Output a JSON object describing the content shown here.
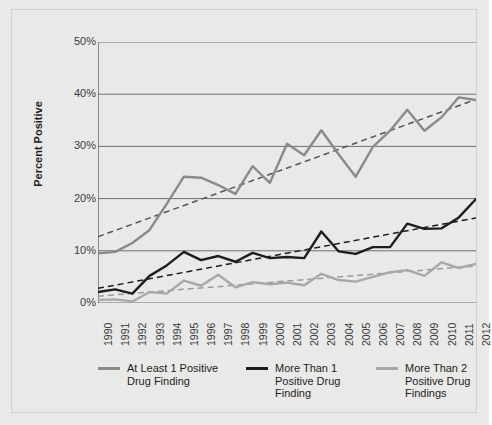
{
  "chart_data": {
    "type": "line",
    "title": "",
    "xlabel": "",
    "ylabel": "Percent Positive",
    "ylim": [
      0,
      50
    ],
    "ytick_labels": [
      "0%",
      "10%",
      "20%",
      "30%",
      "40%",
      "50%"
    ],
    "ytick_values": [
      0,
      10,
      20,
      30,
      40,
      50
    ],
    "grid": true,
    "legend_position": "bottom",
    "categories": [
      1990,
      1991,
      1992,
      1993,
      1994,
      1995,
      1996,
      1997,
      1998,
      1999,
      2000,
      2001,
      2002,
      2003,
      2004,
      2005,
      2006,
      2007,
      2008,
      2009,
      2010,
      2011,
      2012
    ],
    "xtick_labels": [
      "1990",
      "1991",
      "1992",
      "1993",
      "1994",
      "1995",
      "1996",
      "1997",
      "1998",
      "1999",
      "2000",
      "2001",
      "2002",
      "2003",
      "2004",
      "2005",
      "2006",
      "2007",
      "2008",
      "2009",
      "2010",
      "2011",
      "2012"
    ],
    "series": [
      {
        "name": "At Least 1 Positive Drug Finding",
        "color": "#8a8a88",
        "width": 2.4,
        "values": [
          9.5,
          9.8,
          11.5,
          14.0,
          19.0,
          24.2,
          24.0,
          22.6,
          20.9,
          26.2,
          23.0,
          30.5,
          28.3,
          33.1,
          28.5,
          24.2,
          29.9,
          33.0,
          37.0,
          33.0,
          35.6,
          39.4,
          38.9
        ],
        "trend": {
          "style": "dashed",
          "color": "#555553",
          "start": 12.7,
          "end": 39.0
        }
      },
      {
        "name": "More Than 1 Positive Drug Finding",
        "color": "#1d1d1b",
        "width": 2.4,
        "values": [
          2.1,
          2.6,
          1.8,
          5.2,
          7.2,
          9.8,
          8.2,
          9.0,
          7.9,
          9.6,
          8.6,
          8.8,
          8.6,
          13.7,
          9.9,
          9.4,
          10.7,
          10.7,
          15.2,
          14.2,
          14.3,
          16.4,
          19.9
        ],
        "trend": {
          "style": "dashed",
          "color": "#1d1d1b",
          "start": 2.8,
          "end": 16.3
        }
      },
      {
        "name": "More Than 2 Positive Drug Findings",
        "color": "#a8a8a6",
        "width": 2.4,
        "values": [
          0.6,
          0.7,
          0.3,
          2.1,
          1.8,
          4.3,
          3.3,
          5.4,
          3.0,
          4.0,
          3.6,
          3.9,
          3.4,
          5.6,
          4.4,
          4.1,
          5.0,
          5.9,
          6.3,
          5.2,
          7.8,
          6.7,
          7.5
        ],
        "trend": {
          "style": "dashed",
          "color": "#9b9b99",
          "start": 1.3,
          "end": 7.1
        }
      }
    ]
  },
  "axis": {
    "y_title": "Percent Positive"
  },
  "legend": {
    "entries": [
      {
        "label_line1": "At Least 1 Positive",
        "label_line2": "Drug Finding",
        "label_line3": "",
        "color": "#8a8a88"
      },
      {
        "label_line1": "More Than 1",
        "label_line2": "Positive Drug",
        "label_line3": "Finding",
        "color": "#1d1d1b"
      },
      {
        "label_line1": "More Than 2",
        "label_line2": "Positive Drug",
        "label_line3": "Findings",
        "color": "#a8a8a6"
      }
    ]
  },
  "colors": {
    "background": "#e9e9e7",
    "gridline": "#6f6f6d",
    "axis": "#4a4a48",
    "text": "#1d1d1b"
  }
}
